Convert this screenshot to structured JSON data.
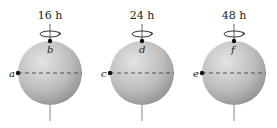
{
  "figure": {
    "spheres": [
      {
        "period_label": "16 h",
        "equator_point": "a",
        "pole_point": "b",
        "cx": 50,
        "cy": 73,
        "r": 32
      },
      {
        "period_label": "24 h",
        "equator_point": "c",
        "pole_point": "d",
        "cx": 142,
        "cy": 73,
        "r": 32
      },
      {
        "period_label": "48 h",
        "equator_point": "e",
        "pole_point": "f",
        "cx": 234,
        "cy": 73,
        "r": 32
      }
    ],
    "colors": {
      "sphere_light": "#e2e2e2",
      "sphere_dark": "#9a9a9a",
      "ink": "#222222"
    }
  }
}
